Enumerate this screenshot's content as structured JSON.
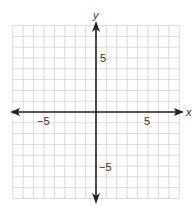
{
  "chart_data": {
    "type": "coordinate-plane",
    "title": "",
    "xlabel": "x",
    "ylabel": "y",
    "xlim": [
      -8,
      8
    ],
    "ylim": [
      -8,
      8
    ],
    "grid": true,
    "grid_step": 1,
    "x_tick_labels": [
      {
        "value": -5,
        "label": "−5"
      },
      {
        "value": 5,
        "label": "5"
      }
    ],
    "y_tick_labels": [
      {
        "value": 5,
        "label": "5"
      },
      {
        "value": -5,
        "label": "−5"
      }
    ],
    "axis_arrows": true,
    "series": []
  },
  "labels": {
    "x_axis": "x",
    "y_axis": "y",
    "x_neg5": "−5",
    "x_pos5": "5",
    "y_pos5": "5",
    "y_neg5": "−5"
  },
  "colors": {
    "grid": "#cfcfcf",
    "axis": "#222222",
    "text": "#333333",
    "background": "#ffffff"
  }
}
